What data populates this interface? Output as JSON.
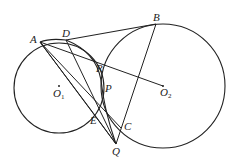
{
  "diagram": {
    "type": "geometry",
    "colors": {
      "stroke": "#222222",
      "background": "#ffffff"
    },
    "circles": [
      {
        "name": "O1",
        "cx": 59,
        "cy": 88,
        "r": 45
      },
      {
        "name": "O2",
        "cx": 163,
        "cy": 86,
        "r": 62
      }
    ],
    "points": {
      "A": {
        "label": "A",
        "x": 40,
        "y": 42
      },
      "D": {
        "label": "D",
        "x": 66,
        "y": 40
      },
      "B": {
        "label": "B",
        "x": 156,
        "y": 24
      },
      "R": {
        "label": "R",
        "x": 99,
        "y": 79
      },
      "P": {
        "label": "P",
        "x": 102,
        "y": 90
      },
      "E": {
        "label": "E",
        "x": 97,
        "y": 118
      },
      "C": {
        "label": "C",
        "x": 121,
        "y": 128
      },
      "Q": {
        "label": "Q",
        "x": 116,
        "y": 144
      },
      "O1": {
        "label": "O",
        "sub": "1",
        "x": 59,
        "y": 86
      },
      "O2": {
        "label": "O",
        "sub": "2",
        "x": 163,
        "y": 86
      }
    },
    "labels": {
      "A": "A",
      "B": "B",
      "D": "D",
      "R": "R",
      "P": "P",
      "E": "E",
      "C": "C",
      "Q": "Q",
      "O1_main": "O",
      "O1_sub": "1",
      "O2_main": "O",
      "O2_sub": "2"
    },
    "segments": [
      [
        "A",
        "B"
      ],
      [
        "A",
        "O2"
      ],
      [
        "A",
        "E"
      ],
      [
        "A",
        "Q"
      ],
      [
        "A",
        "C"
      ],
      [
        "D",
        "Q"
      ],
      [
        "B",
        "Q"
      ],
      [
        "E",
        "Q"
      ]
    ],
    "arcs": [
      "arc D-R-P-Q through circle centered near E region"
    ]
  }
}
